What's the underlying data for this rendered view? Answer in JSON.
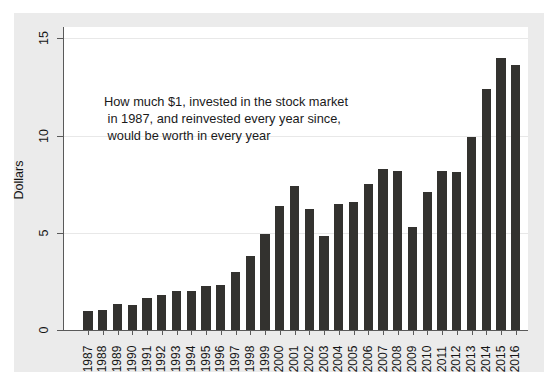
{
  "chart_data": {
    "type": "bar",
    "title": "",
    "subtitle": "",
    "xlabel": "",
    "ylabel": "Dollars",
    "ylim": [
      0,
      15.7
    ],
    "yticks": [
      0,
      5,
      10,
      15
    ],
    "ytick_labels": [
      "0",
      "5",
      "10",
      "15"
    ],
    "grid": true,
    "legend": null,
    "bar_color": "#33322f",
    "plot_background": "#ffffff",
    "canvas_background": "#ebebeb",
    "annotation": "How much $1, invested in the stock market\n in 1987, and reinvested every year since,\n would be worth in every year",
    "categories": [
      "1987",
      "1988",
      "1989",
      "1990",
      "1991",
      "1992",
      "1993",
      "1994",
      "1995",
      "1996",
      "1997",
      "1998",
      "1999",
      "2000",
      "2001",
      "2002",
      "2003",
      "2004",
      "2005",
      "2006",
      "2007",
      "2008",
      "2009",
      "2010",
      "2011",
      "2012",
      "2013",
      "2014",
      "2015",
      "2016"
    ],
    "values": [
      1.0,
      1.05,
      1.35,
      1.3,
      1.65,
      1.8,
      2.0,
      2.0,
      2.25,
      2.3,
      3.0,
      3.8,
      4.95,
      6.4,
      7.4,
      6.2,
      4.85,
      6.5,
      6.6,
      7.5,
      8.3,
      8.2,
      5.3,
      7.1,
      8.2,
      8.1,
      9.9,
      12.4,
      14.0,
      13.6
    ]
  },
  "axes": {
    "y_title": "Dollars"
  }
}
